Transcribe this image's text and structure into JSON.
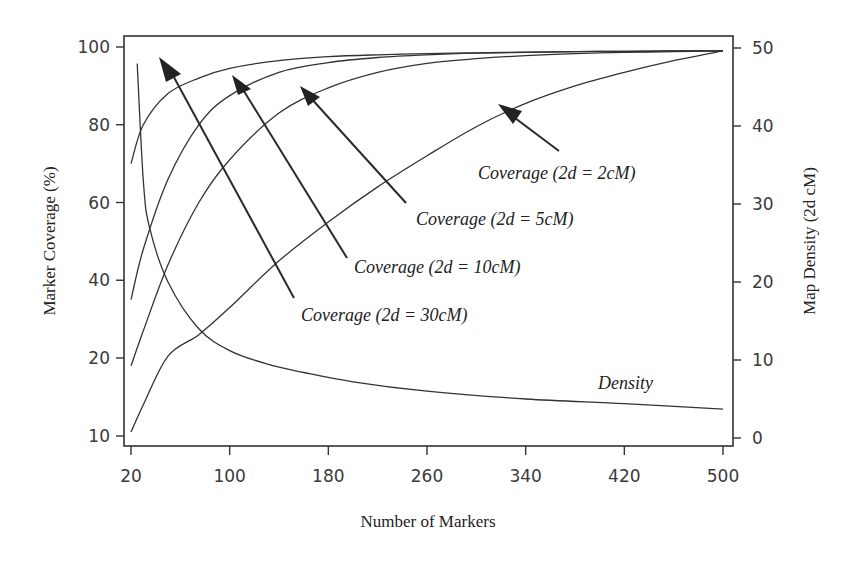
{
  "chart_data": {
    "type": "line",
    "title": "",
    "xlabel": "Number of Markers",
    "ylabel": "Marker Coverage (%)",
    "ylabel_right": "Map Density (2d cM)",
    "xlim": [
      20,
      500
    ],
    "ylim": [
      10,
      100
    ],
    "ylim_right": [
      0,
      50
    ],
    "grid": false,
    "legend": "none (curves labeled with arrow annotations)",
    "x_ticks": [
      "20",
      "100",
      "180",
      "260",
      "340",
      "420",
      "500"
    ],
    "y_ticks_left": [
      "100",
      "80",
      "60",
      "40",
      "20",
      "10"
    ],
    "y_ticks_right": [
      "50",
      "40",
      "30",
      "20",
      "10",
      "0"
    ],
    "x": [
      20,
      30,
      50,
      75,
      100,
      140,
      180,
      220,
      260,
      300,
      340,
      380,
      420,
      460,
      500
    ],
    "series": [
      {
        "name": "Coverage (2d = 30cM)",
        "axis": "left",
        "label": "Coverage (2d = 30cM)",
        "values": [
          70,
          80,
          88,
          92,
          94.5,
          96.5,
          97.5,
          98,
          98.3,
          98.5,
          98.7,
          98.8,
          98.9,
          99,
          99
        ]
      },
      {
        "name": "Coverage (2d = 10cM)",
        "axis": "left",
        "label": "Coverage (2d = 10cM)",
        "values": [
          35,
          48,
          66,
          80,
          87.5,
          93.5,
          96,
          97.3,
          98,
          98.4,
          98.6,
          98.8,
          98.9,
          99,
          99
        ]
      },
      {
        "name": "Coverage (2d = 5cM)",
        "axis": "left",
        "label": "Coverage (2d = 5cM)",
        "values": [
          19,
          27,
          44,
          60,
          71,
          83,
          89.5,
          93.5,
          95.8,
          97,
          97.8,
          98.3,
          98.6,
          98.8,
          99
        ]
      },
      {
        "name": "Coverage (2d = 2cM)",
        "axis": "left",
        "label": "Coverage (2d = 2cM)",
        "values": [
          10.5,
          14,
          20.5,
          26,
          33,
          45,
          55,
          64,
          72,
          79.5,
          85.5,
          90,
          93.5,
          96.5,
          99
        ]
      },
      {
        "name": "Density",
        "axis": "right",
        "label": "Density",
        "x": [
          25,
          30,
          35,
          50,
          75,
          100,
          130,
          160,
          200,
          260,
          340,
          420,
          500
        ],
        "values": [
          48,
          33,
          27,
          20,
          14,
          11.2,
          9.5,
          8.4,
          7.2,
          6,
          5,
          4.4,
          3.7
        ]
      }
    ],
    "annotations": [
      {
        "text": "Coverage (2d = 2cM)",
        "arrow_to_x": 335,
        "arrow_to_series": "Coverage (2d = 2cM)"
      },
      {
        "text": "Coverage (2d = 5cM)",
        "arrow_to_x": 165,
        "arrow_to_series": "Coverage (2d = 5cM)"
      },
      {
        "text": "Coverage (2d = 10cM)",
        "arrow_to_x": 100,
        "arrow_to_series": "Coverage (2d = 10cM)"
      },
      {
        "text": "Coverage (2d = 30cM)",
        "arrow_to_x": 42,
        "arrow_to_series": "Coverage (2d = 30cM)"
      },
      {
        "text": "Density",
        "near_x": 460
      }
    ]
  },
  "labels": {
    "xlabel": "Number of Markers",
    "ylabel_left": "Marker Coverage (%)",
    "ylabel_right": "Map Density (2d  cM)",
    "annot_2cM": "Coverage (2d = 2cM)",
    "annot_5cM": "Coverage (2d = 5cM)",
    "annot_10cM": "Coverage (2d = 10cM)",
    "annot_30cM": "Coverage (2d = 30cM)",
    "annot_density": "Density"
  }
}
